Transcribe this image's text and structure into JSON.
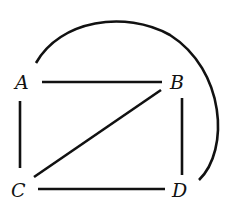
{
  "diagram": {
    "type": "graph",
    "nodes": [
      {
        "id": "A",
        "label": "A"
      },
      {
        "id": "B",
        "label": "B"
      },
      {
        "id": "C",
        "label": "C"
      },
      {
        "id": "D",
        "label": "D"
      }
    ],
    "edges": [
      {
        "from": "A",
        "to": "B",
        "shape": "straight"
      },
      {
        "from": "A",
        "to": "C",
        "shape": "straight"
      },
      {
        "from": "B",
        "to": "D",
        "shape": "straight"
      },
      {
        "from": "C",
        "to": "D",
        "shape": "straight"
      },
      {
        "from": "B",
        "to": "C",
        "shape": "straight"
      },
      {
        "from": "A",
        "to": "D",
        "shape": "arc"
      }
    ],
    "colors": {
      "stroke": "#111111",
      "background": "#ffffff"
    }
  }
}
